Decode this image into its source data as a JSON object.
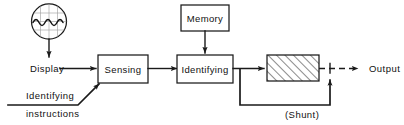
{
  "diagram": {
    "colors": {
      "stroke": "#1a1a1a",
      "background": "#ffffff",
      "grid": "#9a9a9a",
      "hatch": "#1a1a1a"
    },
    "nodes": {
      "display_icon": {
        "label": "display-oscilloscope",
        "shape": "circle-with-waveform"
      },
      "display": {
        "label": "Display"
      },
      "sensing": {
        "label": "Sensing"
      },
      "identifying_block": {
        "label": "Identifying"
      },
      "memory": {
        "label": "Memory"
      },
      "hatched_block": {
        "label": "",
        "fill": "diagonal-hatch"
      },
      "output": {
        "label": "Output"
      },
      "identifying_instructions_line1": {
        "label": "Identifying"
      },
      "identifying_instructions_line2": {
        "label": "instructions"
      },
      "shunt": {
        "label": "(Shunt)"
      }
    },
    "edges": [
      {
        "from": "display_icon",
        "to": "display",
        "style": "solid-arrow"
      },
      {
        "from": "display",
        "to": "sensing",
        "style": "solid-arrow"
      },
      {
        "from": "identifying_instructions",
        "to": "sensing",
        "style": "solid-angled"
      },
      {
        "from": "sensing",
        "to": "identifying_block",
        "style": "solid-arrow"
      },
      {
        "from": "memory",
        "to": "identifying_block",
        "style": "solid-arrow"
      },
      {
        "from": "identifying_block",
        "to": "hatched_block",
        "style": "solid-arrow"
      },
      {
        "from": "hatched_block",
        "to": "output",
        "style": "dashed-arrow"
      },
      {
        "from": "identifying_block",
        "to": "output_junction",
        "style": "solid-shunt-loop"
      }
    ]
  }
}
